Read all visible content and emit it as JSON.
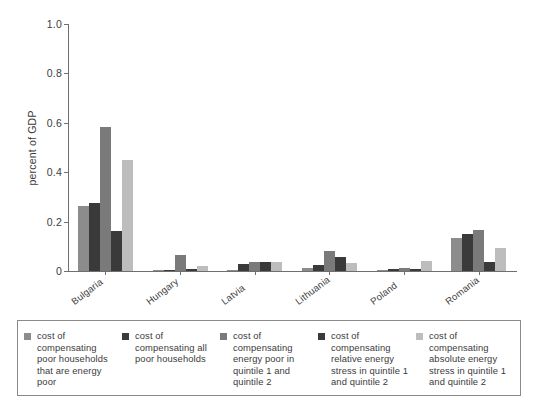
{
  "chart_data": {
    "type": "bar",
    "title": "",
    "xlabel": "",
    "ylabel": "percent of GDP",
    "ylim": [
      0,
      1.0
    ],
    "yticks": [
      "0",
      "0.2",
      "0.4",
      "0.6",
      "0.8",
      "1.0"
    ],
    "ytick_values": [
      0,
      0.2,
      0.4,
      0.6,
      0.8,
      1.0
    ],
    "grid": false,
    "legend_position": "bottom",
    "categories": [
      "Bulgaria",
      "Hungary",
      "Latvia",
      "Lithuania",
      "Poland",
      "Romania"
    ],
    "series": [
      {
        "name": "cost of compensating poor households that are energy poor",
        "color": "#8c8c8c",
        "values": [
          0.265,
          0.005,
          0.005,
          0.012,
          0.006,
          0.135
        ]
      },
      {
        "name": "cost of compensating all poor households",
        "color": "#3a3a3a",
        "values": [
          0.277,
          0.006,
          0.028,
          0.026,
          0.007,
          0.148
        ]
      },
      {
        "name": "cost of compensating energy poor in quintile 1 and quintile 2",
        "color": "#7a7a7a",
        "values": [
          0.585,
          0.064,
          0.036,
          0.083,
          0.012,
          0.165
        ]
      },
      {
        "name": "cost of compensating relative energy stress in quintile 1 and quintile 2",
        "color": "#3a3a3a",
        "values": [
          0.162,
          0.007,
          0.035,
          0.056,
          0.01,
          0.038
        ]
      },
      {
        "name": "cost of compensating absolute energy stress in quintile 1 and quintile 2",
        "color": "#bdbdbd",
        "values": [
          0.448,
          0.019,
          0.037,
          0.034,
          0.042,
          0.092
        ]
      }
    ]
  },
  "legend": {
    "items": [
      {
        "label": "cost of compensating poor households that are energy poor",
        "color": "#8c8c8c"
      },
      {
        "label": "cost of compensating all poor households",
        "color": "#3a3a3a"
      },
      {
        "label": "cost of compensating energy poor in quintile 1 and quintile 2",
        "color": "#7a7a7a"
      },
      {
        "label": "cost of compensating relative energy stress in quintile 1 and quintile 2",
        "color": "#3a3a3a"
      },
      {
        "label": "cost of compensating absolute energy stress in quintile 1 and quintile 2",
        "color": "#bdbdbd"
      }
    ]
  },
  "colors": {
    "axis": "#6f6f6f",
    "text": "#3b3b3b",
    "legend_border": "#8a8a8a",
    "background": "#ffffff"
  }
}
